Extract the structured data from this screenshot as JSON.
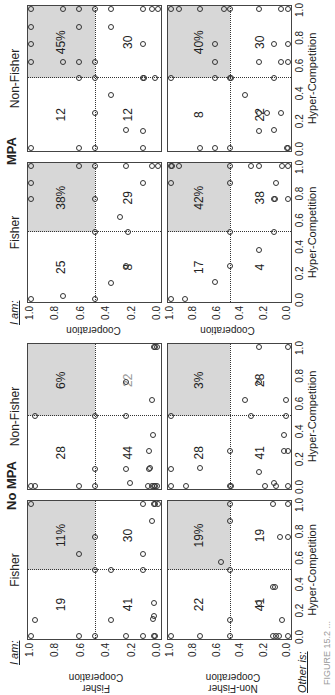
{
  "figure": {
    "rotation_deg": -90,
    "groups": [
      {
        "title": "No MPA",
        "columns": [
          "Fisher",
          "Non-Fisher"
        ]
      },
      {
        "title": "MPA",
        "columns": [
          "Fisher",
          "Non-Fisher"
        ]
      }
    ],
    "i_am_label": "I am:",
    "other_is_label": "Other is:",
    "row_labels": [
      "Fisher\nCooperation",
      "Non-Fisher\nCooperation"
    ],
    "row_label_fisher": "Fisher",
    "row_label_nonfisher": "Non-Fisher",
    "y_axis_label": "Cooperation",
    "x_axis_label": "Hyper-Competition",
    "x_ticks": [
      "0.0",
      "0.2",
      "0.4",
      "0.6",
      "0.8",
      "1.0"
    ],
    "y_ticks": [
      "1.0",
      "0.8",
      "0.6",
      "0.4",
      "0.2",
      "0.0"
    ],
    "caption": "FIGURE 15.2 ..."
  },
  "chart_data": {
    "type": "scatter",
    "title": "",
    "xlabel": "Hyper-Competition",
    "ylabel": "Cooperation",
    "xlim": [
      0,
      1
    ],
    "ylim": [
      0,
      1
    ],
    "grid": false,
    "quadrant_split": {
      "x": 0.5,
      "y": 0.5
    },
    "shaded_quadrant": "top-right (high hyper-competition, high cooperation)",
    "panels": [
      {
        "group": "No MPA",
        "i_am": "Fisher",
        "other_is": "Fisher",
        "quadrants": {
          "top_left": "19",
          "bottom_left": "41",
          "bottom_right": "30",
          "top_right_pct": "11%"
        },
        "points": [
          [
            0,
            1
          ],
          [
            0.12,
            0.97
          ],
          [
            0,
            0.62
          ],
          [
            0,
            0.5
          ],
          [
            0,
            0.25
          ],
          [
            0,
            0.12
          ],
          [
            0,
            0.03
          ],
          [
            0,
            0.02
          ],
          [
            0.12,
            0.37
          ],
          [
            0.15,
            0.03
          ],
          [
            0.13,
            0.04
          ],
          [
            0.25,
            0.03
          ],
          [
            0.5,
            0.5
          ],
          [
            0.5,
            0.37
          ],
          [
            0.5,
            0.12
          ],
          [
            0.62,
            0.62
          ],
          [
            0.62,
            0.12
          ],
          [
            0.75,
            0.5
          ],
          [
            0.87,
            0.05
          ],
          [
            1,
            1
          ],
          [
            1,
            0.12
          ],
          [
            1,
            0.03
          ],
          [
            1,
            0.02
          ],
          [
            1,
            0
          ]
        ]
      },
      {
        "group": "No MPA",
        "i_am": "Non-Fisher",
        "other_is": "Fisher",
        "quadrants": {
          "top_left": "28",
          "bottom_left": "44",
          "bottom_right": "22",
          "top_right_pct": "6%"
        },
        "bottom_right_grey": true,
        "points": [
          [
            0,
            1
          ],
          [
            0,
            0.97
          ],
          [
            0.5,
            0.97
          ],
          [
            0,
            0.62
          ],
          [
            0,
            0.5
          ],
          [
            0.12,
            0.5
          ],
          [
            0.5,
            0.5
          ],
          [
            0.5,
            0.25
          ],
          [
            0.75,
            0.25
          ],
          [
            0.12,
            0.25
          ],
          [
            0.02,
            0.22
          ],
          [
            0,
            0.03
          ],
          [
            0,
            0.02
          ],
          [
            0,
            0.08
          ],
          [
            0,
            0.05
          ],
          [
            0,
            0.01
          ],
          [
            0.25,
            0.07
          ],
          [
            0.12,
            0.07
          ],
          [
            0.13,
            0.06
          ],
          [
            0.37,
            0.04
          ],
          [
            0.62,
            0.05
          ],
          [
            1,
            0.03
          ],
          [
            1,
            0.02
          ],
          [
            1,
            0.01
          ]
        ]
      },
      {
        "group": "No MPA",
        "i_am": "Fisher",
        "other_is": "Non-Fisher",
        "quadrants": {
          "top_left": "22",
          "bottom_left": "41",
          "bottom_right": "19",
          "top_right_pct": "19%"
        },
        "points": [
          [
            0,
            1
          ],
          [
            0,
            0.75
          ],
          [
            0,
            0.5
          ],
          [
            0.12,
            0.5
          ],
          [
            0.5,
            0.5
          ],
          [
            0.56,
            0.57
          ],
          [
            0.87,
            0.5
          ],
          [
            1,
            0.5
          ],
          [
            0.37,
            0.13
          ],
          [
            0.37,
            0.11
          ],
          [
            0.25,
            0.25
          ],
          [
            0.12,
            0.05
          ],
          [
            0,
            0.13
          ],
          [
            0,
            0.1
          ],
          [
            0,
            0.08
          ],
          [
            0,
            0
          ],
          [
            0.75,
            0.07
          ],
          [
            0.75,
            0
          ],
          [
            1,
            0.13
          ],
          [
            1,
            0
          ]
        ]
      },
      {
        "group": "No MPA",
        "i_am": "Non-Fisher",
        "other_is": "Non-Fisher",
        "quadrants": {
          "top_left": "28",
          "bottom_left": "41",
          "bottom_right": "28",
          "top_right_pct": "3%"
        },
        "points": [
          [
            0.5,
            1
          ],
          [
            0.12,
            1
          ],
          [
            0.13,
            0.75
          ],
          [
            0,
            1
          ],
          [
            0,
            0.87
          ],
          [
            0,
            0.5
          ],
          [
            0.25,
            0.5
          ],
          [
            0,
            0.49
          ],
          [
            0.62,
            0.37
          ],
          [
            0.5,
            0.32
          ],
          [
            0.75,
            0.25
          ],
          [
            1,
            0.25
          ],
          [
            0.25,
            0.03
          ],
          [
            0.37,
            0.03
          ],
          [
            0.62,
            0.02
          ],
          [
            0.1,
            0.25
          ],
          [
            0,
            0.2
          ],
          [
            0,
            0.1
          ],
          [
            0.02,
            0.12
          ],
          [
            1,
            0
          ],
          [
            0,
            0
          ],
          [
            0.25,
            0
          ],
          [
            0.5,
            0.02
          ]
        ]
      },
      {
        "group": "MPA",
        "i_am": "Fisher",
        "other_is": "Fisher",
        "quadrants": {
          "top_left": "25",
          "bottom_left": "8",
          "bottom_right": "29",
          "top_right_pct": "38%"
        },
        "points": [
          [
            0,
            1
          ],
          [
            0.02,
            0.75
          ],
          [
            0,
            0.5
          ],
          [
            0.12,
            0.37
          ],
          [
            0.25,
            0.25
          ],
          [
            0.5,
            0.5
          ],
          [
            0.5,
            0.24
          ],
          [
            0.62,
            0.3
          ],
          [
            0.75,
            1
          ],
          [
            0.75,
            0.5
          ],
          [
            0.87,
            1
          ],
          [
            0.87,
            0.12
          ],
          [
            1,
            1
          ],
          [
            1,
            0.62
          ],
          [
            1,
            0.5
          ],
          [
            1,
            0.25
          ],
          [
            1,
            0.05
          ],
          [
            1,
            0
          ]
        ]
      },
      {
        "group": "MPA",
        "i_am": "Non-Fisher",
        "other_is": "Fisher",
        "quadrants": {
          "top_left": "12",
          "bottom_left": "12",
          "bottom_right": "30",
          "top_right_pct": "45%"
        },
        "points": [
          [
            0,
            1
          ],
          [
            0,
            0.62
          ],
          [
            0,
            0.5
          ],
          [
            0.25,
            0.5
          ],
          [
            0.38,
            0.37
          ],
          [
            0.13,
            0.25
          ],
          [
            0.12,
            0.12
          ],
          [
            0,
            0.12
          ],
          [
            0.5,
            0.62
          ],
          [
            0.5,
            0.5
          ],
          [
            0.5,
            0.12
          ],
          [
            0.5,
            0.11
          ],
          [
            0.5,
            0.02
          ],
          [
            0.62,
            1
          ],
          [
            0.62,
            0.75
          ],
          [
            0.62,
            0.62
          ],
          [
            0.62,
            0.5
          ],
          [
            0.75,
            1
          ],
          [
            0.75,
            0.12
          ],
          [
            0.87,
            1
          ],
          [
            0.87,
            0.62
          ],
          [
            0.87,
            0.37
          ],
          [
            1,
            1
          ],
          [
            1,
            0.75
          ],
          [
            1,
            0.62
          ],
          [
            1,
            0.5
          ],
          [
            1,
            0.37
          ],
          [
            1,
            0.12
          ],
          [
            1,
            0.05
          ],
          [
            1,
            0
          ]
        ]
      },
      {
        "group": "MPA",
        "i_am": "Fisher",
        "other_is": "Non-Fisher",
        "quadrants": {
          "top_left": "17",
          "bottom_left": "4",
          "bottom_right": "38",
          "top_right_pct": "42%"
        },
        "points": [
          [
            0,
            1
          ],
          [
            0,
            0.88
          ],
          [
            0.13,
            0.62
          ],
          [
            0.25,
            0.5
          ],
          [
            0.37,
            0.25
          ],
          [
            0.5,
            0.5
          ],
          [
            0.5,
            0.12
          ],
          [
            0.75,
            0.12
          ],
          [
            0.75,
            0.11
          ],
          [
            0.75,
            0
          ],
          [
            0.87,
            1
          ],
          [
            0.87,
            0.5
          ],
          [
            0.87,
            0.1
          ],
          [
            1,
            1
          ],
          [
            1,
            0.99
          ],
          [
            1,
            0.93
          ],
          [
            1,
            0.5
          ],
          [
            1,
            0.32
          ],
          [
            1,
            0.25
          ],
          [
            1,
            0.05
          ],
          [
            1,
            0
          ]
        ]
      },
      {
        "group": "MPA",
        "i_am": "Non-Fisher",
        "other_is": "Non-Fisher",
        "quadrants": {
          "top_left": "8",
          "bottom_left": "22",
          "bottom_right": "30",
          "top_right_pct": "40%"
        },
        "points": [
          [
            0,
            0.75
          ],
          [
            0,
            0.62
          ],
          [
            0,
            0.5
          ],
          [
            0.12,
            0.25
          ],
          [
            0.13,
            0.12
          ],
          [
            0.25,
            0.25
          ],
          [
            0.25,
            0.18
          ],
          [
            0.25,
            0.06
          ],
          [
            0.38,
            0.37
          ],
          [
            0,
            0
          ],
          [
            0,
            0.01
          ],
          [
            0.5,
            1
          ],
          [
            0.5,
            0.62
          ],
          [
            0.5,
            0.5
          ],
          [
            0.5,
            0.49
          ],
          [
            0.5,
            0.12
          ],
          [
            0.62,
            0.62
          ],
          [
            0.62,
            0.25
          ],
          [
            0.62,
            0.06
          ],
          [
            0.62,
            0
          ],
          [
            0.75,
            0.62
          ],
          [
            0.75,
            0.12
          ],
          [
            0.75,
            0
          ],
          [
            1,
            1
          ],
          [
            1,
            0.93
          ],
          [
            1,
            0.75
          ],
          [
            1,
            0.55
          ],
          [
            1,
            0.5
          ],
          [
            1,
            0.25
          ],
          [
            1,
            0.06
          ],
          [
            1,
            0
          ]
        ]
      }
    ]
  }
}
